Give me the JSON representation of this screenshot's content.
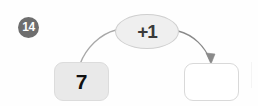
{
  "problem": {
    "number": "14",
    "badge_color": "#6e6e6e",
    "badge_text_color": "#ffffff"
  },
  "function_machine": {
    "operation": {
      "label": "+1",
      "shape": "ellipse",
      "fill_color": "#efefef",
      "border_color": "#cfcfcf",
      "text_color": "#3a3a3a"
    },
    "input": {
      "value": "7",
      "fill_color": "#e9e9e9",
      "border_color": "#dcdcdc",
      "text_color": "#101010",
      "filled": true
    },
    "output": {
      "value": "",
      "fill_color": "#ffffff",
      "border_color": "#d9d9d9",
      "text_color": "#101010",
      "filled": false
    },
    "arrows": [
      {
        "name": "input-to-operation",
        "from": "input-box",
        "to": "operation-bubble",
        "has_arrowhead": false,
        "color": "#a8a8a8"
      },
      {
        "name": "operation-to-output",
        "from": "operation-bubble",
        "to": "output-box",
        "has_arrowhead": true,
        "color": "#8a8a8a"
      }
    ]
  },
  "page": {
    "background_color": "#fefefe"
  }
}
